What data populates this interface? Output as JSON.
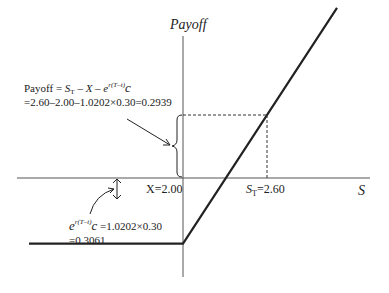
{
  "chart_data": {
    "type": "line",
    "title": "",
    "xlabel": "S",
    "ylabel": "Payoff",
    "strike_label": "X=2.00",
    "spot_label_base": "S",
    "spot_label_sub": "T",
    "spot_label_value": "=2.60",
    "strike": 2.0,
    "spot": 2.6,
    "premium_fv": 0.3061,
    "payoff_at_spot": 0.2939,
    "series": [
      {
        "name": "long call payoff",
        "points": [
          [
            0.9,
            -0.3061
          ],
          [
            2.0,
            -0.3061
          ],
          [
            3.1,
            0.7939
          ]
        ]
      }
    ]
  },
  "annotations": {
    "payoff_formula": {
      "prefix": "Payoff = ",
      "s": "S",
      "s_sub": "T",
      "minus_x": " – X – e",
      "exp": "r(T–t)",
      "c": "c",
      "line2": "=2.60–2.00–1.0202×0.30=0.2939"
    },
    "premium_formula": {
      "e": "e",
      "exp": "r(T–t)",
      "c": "c",
      "rest": " =1.0202×0.30",
      "line2": "=0.3061"
    }
  }
}
